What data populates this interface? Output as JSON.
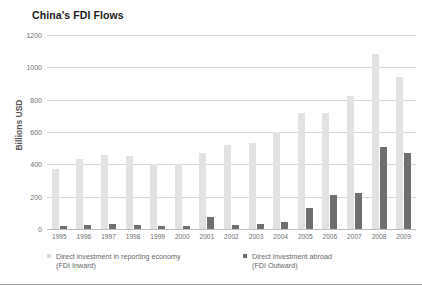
{
  "chart_data": {
    "type": "bar",
    "title": "China's FDI Flows",
    "xlabel": "",
    "ylabel": "Billions USD",
    "ylim": [
      0,
      1200
    ],
    "yticks": [
      0,
      200,
      400,
      600,
      800,
      1000,
      1200
    ],
    "ytick_labels": [
      "0",
      "200",
      "400",
      "600",
      "800",
      "1000",
      "1200"
    ],
    "grid": true,
    "legend_position": "bottom",
    "categories": [
      "1995",
      "1996",
      "1997",
      "1998",
      "1999",
      "2000",
      "2001",
      "2002",
      "2003",
      "2004",
      "2005",
      "2006",
      "2007",
      "2008",
      "2009"
    ],
    "series": [
      {
        "name": "Direct investment in reporting economy (FDI Inward)",
        "color": "#e2e2e2",
        "values": [
          370,
          430,
          455,
          450,
          400,
          400,
          470,
          520,
          535,
          600,
          715,
          720,
          820,
          1080,
          940
        ]
      },
      {
        "name": "Direct investment abroad (FDI Outward)",
        "color": "#6f6f6f",
        "values": [
          20,
          25,
          30,
          25,
          20,
          20,
          75,
          25,
          30,
          45,
          130,
          210,
          225,
          510,
          470
        ]
      }
    ]
  },
  "legend": {
    "items": [
      {
        "swatch": "swatch-inward",
        "line1": "Direct investment in reporting economy",
        "line2": "(FDI Inward)"
      },
      {
        "swatch": "swatch-outward",
        "line1": "Direct investment abroad",
        "line2": "(FDI Outward)"
      }
    ]
  }
}
